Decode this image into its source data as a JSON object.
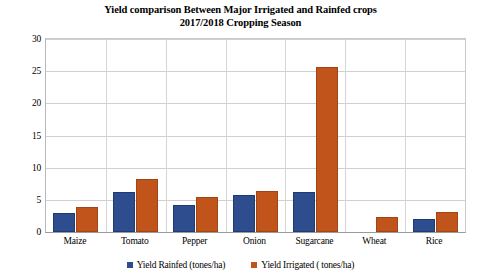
{
  "chart_data": {
    "type": "bar",
    "title": "Yield comparison Between Major Irrigated and Rainfed crops 2017/2018 Cropping Season",
    "title_line1": "Yield comparison Between Major Irrigated and Rainfed crops",
    "title_line2": "2017/2018 Cropping Season",
    "xlabel": "",
    "ylabel": "",
    "ylim": [
      0,
      30
    ],
    "ytick_step": 5,
    "yticks": [
      0,
      5,
      10,
      15,
      20,
      25,
      30
    ],
    "ytick_labels": [
      "0",
      "5",
      "10",
      "15",
      "20",
      "25",
      "30"
    ],
    "grid": true,
    "legend_position": "bottom",
    "categories": [
      "Maize",
      "Tomato",
      "Pepper",
      "Onion",
      "Sugarcane",
      "Wheat",
      "Rice"
    ],
    "series": [
      {
        "name": "Yield Rainfed (tones/ha)",
        "color": "#2E4D8E",
        "values": [
          2.9,
          6.2,
          4.2,
          5.8,
          6.2,
          0,
          2.0
        ]
      },
      {
        "name": "Yield Irrigated ( tones/ha)",
        "color": "#C1541A",
        "values": [
          3.9,
          8.2,
          5.5,
          6.4,
          25.6,
          2.3,
          3.1
        ]
      }
    ]
  },
  "colors": {
    "rainfed": "#2E4D8E",
    "irrigated": "#C1541A",
    "gridline": "#d0d0d0",
    "axis": "#9a9a9a",
    "background": "#ffffff",
    "text": "#000000"
  }
}
